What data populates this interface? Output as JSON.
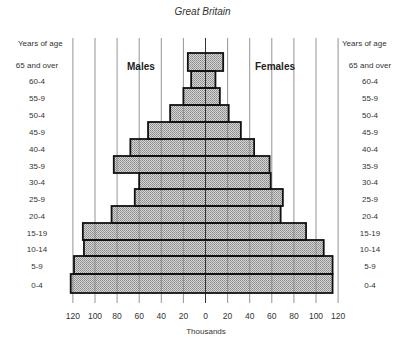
{
  "chart_data": {
    "type": "bar",
    "subtype": "population-pyramid",
    "title": "Great Britain",
    "xlabel": "Thousands",
    "ylabel": "Years of age",
    "side_labels": {
      "left": "Males",
      "right": "Females"
    },
    "categories": [
      "65 and over",
      "60-4",
      "55-9",
      "50-4",
      "45-9",
      "40-4",
      "35-9",
      "30-4",
      "25-9",
      "20-4",
      "15-19",
      "10-14",
      "5-9",
      "0-4"
    ],
    "series": [
      {
        "name": "Males",
        "values": [
          16,
          13,
          20,
          32,
          52,
          68,
          83,
          60,
          64,
          85,
          111,
          110,
          119,
          122
        ]
      },
      {
        "name": "Females",
        "values": [
          16,
          9,
          13,
          21,
          32,
          44,
          58,
          59,
          70,
          68,
          91,
          107,
          115,
          115
        ]
      }
    ],
    "x_ticks": [
      "120",
      "100",
      "80",
      "60",
      "40",
      "20",
      "0",
      "20",
      "40",
      "60",
      "80",
      "100",
      "120"
    ],
    "xlim": [
      -120,
      120
    ],
    "grid": true,
    "legend": "none"
  },
  "labels": {
    "title": "Great Britain",
    "left_axis_title": "Years of age",
    "right_axis_title": "Years of age",
    "males": "Males",
    "females": "Females",
    "xlabel": "Thousands"
  }
}
